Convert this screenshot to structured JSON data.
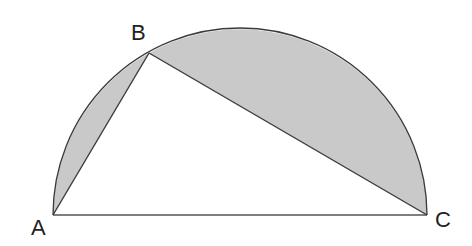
{
  "diagram": {
    "type": "semicircle-inscribed-triangle",
    "colors": {
      "background": "#ffffff",
      "shaded_region": "#c9c9c9",
      "stroke": "#3a3a3a",
      "label": "#222222"
    },
    "points": {
      "A": {
        "label": "A",
        "x": 53,
        "y": 215
      },
      "B": {
        "label": "B",
        "x": 149,
        "y": 53
      },
      "C": {
        "label": "C",
        "x": 427,
        "y": 215
      }
    },
    "labels": {
      "A": "A",
      "B": "B",
      "C": "C"
    },
    "shaded_regions": [
      "segment between arc AB and chord AB",
      "segment between arc BC and chord BC"
    ]
  }
}
